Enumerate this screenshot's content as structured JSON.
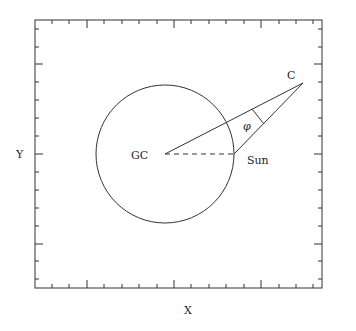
{
  "diagram": {
    "axes": {
      "x_label": "X",
      "y_label": "Y"
    },
    "labels": {
      "galactic_center": "GC",
      "sun": "Sun",
      "cloud": "C",
      "angle": "φ"
    },
    "colors": {
      "ink": "#333333",
      "background": "#ffffff"
    }
  }
}
